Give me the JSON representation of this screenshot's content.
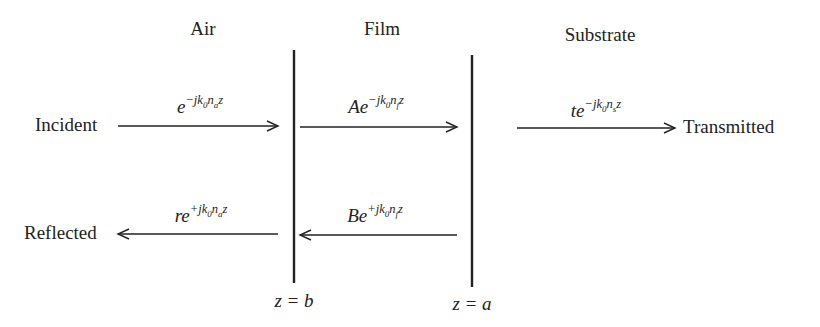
{
  "regions": [
    {
      "label": "Air",
      "x": 203,
      "y": 18
    },
    {
      "label": "Film",
      "x": 382,
      "y": 18
    },
    {
      "label": "Substrate",
      "x": 600,
      "y": 24
    }
  ],
  "waves": {
    "incident": {
      "label": "Incident",
      "amplitude": "",
      "sign": "−",
      "index": "a",
      "direction": "right"
    },
    "reflected": {
      "label": "Reflected",
      "amplitude": "r",
      "sign": "+",
      "index": "a",
      "direction": "left"
    },
    "film_forward": {
      "amplitude": "A",
      "sign": "−",
      "index": "f",
      "direction": "right"
    },
    "film_backward": {
      "amplitude": "B",
      "sign": "+",
      "index": "f",
      "direction": "left"
    },
    "transmitted": {
      "label": "Transmitted",
      "amplitude": "t",
      "sign": "−",
      "index": "s",
      "direction": "right"
    }
  },
  "equation_parts": {
    "base": "e",
    "j": "j",
    "k": "k",
    "k_sub": "0",
    "n": "n",
    "z": "z"
  },
  "boundaries": [
    {
      "label": "z = b",
      "x": 294
    },
    {
      "label": "z = a",
      "x": 472
    }
  ],
  "colors": {
    "line": "#222222",
    "text": "#222222",
    "background": "#ffffff"
  }
}
